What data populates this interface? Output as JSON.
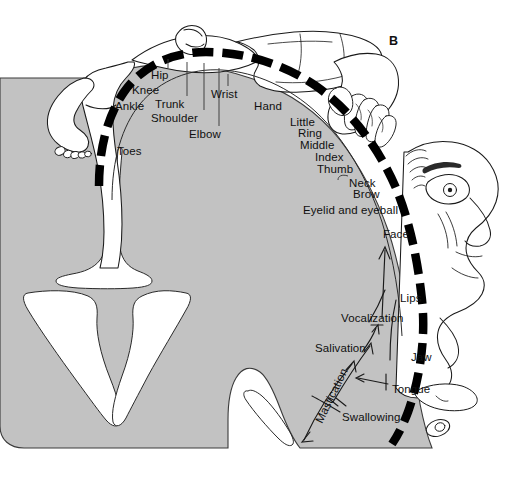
{
  "figure": {
    "panel_letter": "B",
    "title_semantic": "motor-homunculus-diagram",
    "background_color": "#ffffff",
    "cortex_fill_color": "#c2c2c2",
    "cortex_outline_color": "#2a2a2a",
    "motor_strip_color": "#000000",
    "label_color": "#101010"
  },
  "labels": {
    "toes": "Toes",
    "ankle": "Ankle",
    "knee": "Knee",
    "hip": "Hip",
    "trunk": "Trunk",
    "shoulder": "Shoulder",
    "elbow": "Elbow",
    "wrist": "Wrist",
    "hand": "Hand",
    "little": "Little",
    "ring": "Ring",
    "middle": "Middle",
    "index": "Index",
    "thumb": "Thumb",
    "neck": "Neck",
    "brow": "Brow",
    "eyelid_and_eyeball": "Eyelid and eyeball",
    "face": "Face",
    "lips": "Lips",
    "vocalization": "Vocalization",
    "jaw": "Jaw",
    "tongue": "Tongue",
    "salivation": "Salivation",
    "mastication": "Mastication",
    "swallowing": "Swallowing"
  },
  "label_positions": {
    "toes": {
      "x": 117,
      "y": 146
    },
    "ankle": {
      "x": 115,
      "y": 101
    },
    "knee": {
      "x": 132,
      "y": 85
    },
    "hip": {
      "x": 151,
      "y": 70
    },
    "trunk": {
      "x": 155,
      "y": 99
    },
    "shoulder": {
      "x": 151,
      "y": 113
    },
    "elbow": {
      "x": 189,
      "y": 129
    },
    "wrist": {
      "x": 211,
      "y": 89
    },
    "hand": {
      "x": 254,
      "y": 101
    },
    "little": {
      "x": 290,
      "y": 117
    },
    "ring": {
      "x": 298,
      "y": 128
    },
    "middle": {
      "x": 300,
      "y": 140
    },
    "index": {
      "x": 315,
      "y": 152
    },
    "thumb": {
      "x": 317,
      "y": 164
    },
    "neck": {
      "x": 349,
      "y": 178
    },
    "brow": {
      "x": 353,
      "y": 189
    },
    "eyelid_and_eyeball": {
      "x": 303,
      "y": 205
    },
    "face": {
      "x": 383,
      "y": 229
    },
    "lips": {
      "x": 400,
      "y": 293
    },
    "vocalization": {
      "x": 341,
      "y": 313
    },
    "jaw": {
      "x": 411,
      "y": 352
    },
    "tongue": {
      "x": 392,
      "y": 384
    },
    "salivation": {
      "x": 315,
      "y": 343
    },
    "swallowing": {
      "x": 342,
      "y": 412
    },
    "mastication": {
      "x": 314,
      "y": 420,
      "rotation": -64
    },
    "panel_letter": {
      "x": 389,
      "y": 35
    }
  }
}
